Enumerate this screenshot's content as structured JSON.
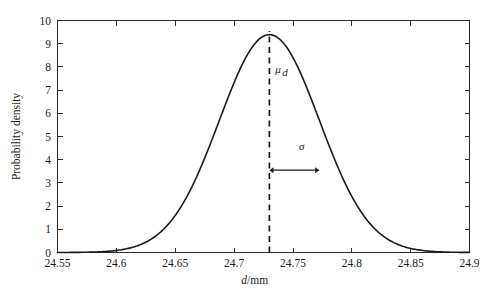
{
  "chart_data": {
    "type": "line",
    "title": "",
    "subtitle": "",
    "xlabel": "d/mm",
    "xlabel_italic_part": "d",
    "xlabel_rest": "/mm",
    "ylabel": "Probability density",
    "xlim": [
      24.55,
      24.9
    ],
    "ylim": [
      0,
      10
    ],
    "grid": false,
    "legend": null,
    "x_ticks": [
      24.55,
      24.6,
      24.65,
      24.7,
      24.75,
      24.8,
      24.85,
      24.9
    ],
    "x_tick_labels": [
      "24.55",
      "24.6",
      "24.65",
      "24.7",
      "24.75",
      "24.8",
      "24.85",
      "24.9"
    ],
    "y_ticks": [
      0,
      1,
      2,
      3,
      4,
      5,
      6,
      7,
      8,
      9,
      10
    ],
    "y_tick_labels": [
      "0",
      "1",
      "2",
      "3",
      "4",
      "5",
      "6",
      "7",
      "8",
      "9",
      "10"
    ],
    "distribution": {
      "kind": "normal",
      "mean": 24.73,
      "sigma": 0.0425,
      "peak_value": 9.39
    },
    "annotations": [
      {
        "name": "mean-label",
        "text": "μ_d",
        "text_base": "μ",
        "text_sub": "d",
        "x": 24.735,
        "y": 7.75
      },
      {
        "name": "sigma-label",
        "text": "σ",
        "x": 24.7575,
        "y": 4.4
      }
    ],
    "mean_marker": {
      "name": "mean-dashed-line",
      "x": 24.73,
      "y_from": 0,
      "y_to": 9.55
    },
    "sigma_marker": {
      "name": "sigma-double-arrow",
      "x_from": 24.73,
      "x_to": 24.7725,
      "y": 3.55
    },
    "series": [
      {
        "name": "probability density",
        "color": "#1a1a1a",
        "x": [
          24.55,
          24.56,
          24.57,
          24.58,
          24.59,
          24.6,
          24.61,
          24.62,
          24.63,
          24.64,
          24.65,
          24.66,
          24.67,
          24.68,
          24.69,
          24.7,
          24.71,
          24.72,
          24.73,
          24.74,
          24.75,
          24.76,
          24.77,
          24.78,
          24.79,
          24.8,
          24.81,
          24.82,
          24.83,
          24.84,
          24.85,
          24.86,
          24.87,
          24.88,
          24.89,
          24.9
        ],
        "values": [
          0.0,
          0.0,
          0.01,
          0.02,
          0.06,
          0.17,
          0.42,
          0.94,
          1.86,
          3.24,
          4.98,
          6.77,
          8.13,
          9.06,
          9.39,
          9.06,
          8.13,
          6.77,
          9.39,
          6.77,
          8.13,
          9.06,
          9.39,
          9.06,
          8.13,
          6.77,
          4.98,
          3.24,
          1.86,
          0.94,
          0.42,
          0.17,
          0.06,
          0.02,
          0.01,
          0.0
        ]
      }
    ]
  },
  "axis": {
    "y_title": "Probability density",
    "x_title_italic": "d",
    "x_title_rest": "/mm"
  }
}
